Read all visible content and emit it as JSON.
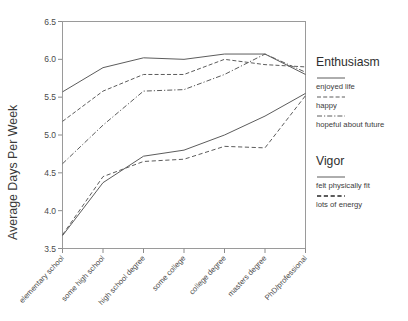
{
  "chart_data": {
    "type": "line",
    "title": "",
    "xlabel": "",
    "ylabel": "Average Days Per Week",
    "ylim": [
      3.5,
      6.5
    ],
    "yticks": [
      3.5,
      4.0,
      4.5,
      5.0,
      5.5,
      6.0,
      6.5
    ],
    "ytick_labels": [
      "3.5",
      "4.0",
      "4.5",
      "5.0",
      "5.5",
      "6.0",
      "6.5"
    ],
    "grid": false,
    "legend_position": "right",
    "categories": [
      "elementary school",
      "some high school",
      "high school degree",
      "some college",
      "college degree",
      "masters degree",
      "PhD/professional"
    ],
    "series": [
      {
        "name": "enjoyed life",
        "group": "Enthusiasm",
        "style": "solid",
        "color": "#5c5c5c",
        "values": [
          5.57,
          5.89,
          6.02,
          6.0,
          6.07,
          6.07,
          5.8
        ]
      },
      {
        "name": "happy",
        "group": "Enthusiasm",
        "style": "dashed",
        "color": "#5c5c5c",
        "values": [
          5.18,
          5.58,
          5.8,
          5.8,
          6.0,
          5.93,
          5.9
        ]
      },
      {
        "name": "hopeful about future",
        "group": "Enthusiasm",
        "style": "dashdot",
        "color": "#5c5c5c",
        "values": [
          4.62,
          5.13,
          5.58,
          5.6,
          5.8,
          6.07,
          5.83
        ]
      },
      {
        "name": "felt physically fit",
        "group": "Vigor",
        "style": "solid",
        "color": "#5c5c5c",
        "values": [
          3.67,
          4.37,
          4.72,
          4.8,
          5.0,
          5.25,
          5.55
        ]
      },
      {
        "name": "lots of energy",
        "group": "Vigor",
        "style": "dashed-thick",
        "color": "#5c5c5c",
        "values": [
          3.68,
          4.45,
          4.65,
          4.68,
          4.85,
          4.83,
          5.52
        ]
      }
    ]
  },
  "legend": {
    "groups": [
      {
        "title": "Enthusiasm",
        "entries": [
          {
            "label": "enjoyed life",
            "style": "solid"
          },
          {
            "label": "happy",
            "style": "dashed"
          },
          {
            "label": "hopeful about future",
            "style": "dashdot"
          }
        ]
      },
      {
        "title": "Vigor",
        "entries": [
          {
            "label": "felt physically fit",
            "style": "solid"
          },
          {
            "label": "lots of energy",
            "style": "dashed-thick"
          }
        ]
      }
    ]
  }
}
